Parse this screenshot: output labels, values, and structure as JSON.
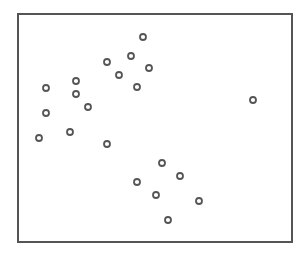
{
  "chart_data": {
    "type": "scatter",
    "title": "",
    "xlabel": "",
    "ylabel": "",
    "grid": false,
    "legend": null,
    "axis_ticks": "none",
    "marker": "open-circle",
    "colors": {
      "frame": "#555555",
      "marker": "#555555",
      "background": "#ffffff"
    },
    "frame_px": {
      "left": 18,
      "top": 14,
      "right": 292,
      "bottom": 242
    },
    "points_px": [
      {
        "x": 143,
        "y": 37
      },
      {
        "x": 131,
        "y": 56
      },
      {
        "x": 107,
        "y": 62
      },
      {
        "x": 149,
        "y": 68
      },
      {
        "x": 119,
        "y": 75
      },
      {
        "x": 76,
        "y": 81
      },
      {
        "x": 46,
        "y": 88
      },
      {
        "x": 137,
        "y": 87
      },
      {
        "x": 76,
        "y": 94
      },
      {
        "x": 88,
        "y": 107
      },
      {
        "x": 46,
        "y": 113
      },
      {
        "x": 253,
        "y": 100
      },
      {
        "x": 39,
        "y": 138
      },
      {
        "x": 70,
        "y": 132
      },
      {
        "x": 107,
        "y": 144
      },
      {
        "x": 162,
        "y": 163
      },
      {
        "x": 180,
        "y": 176
      },
      {
        "x": 137,
        "y": 182
      },
      {
        "x": 156,
        "y": 195
      },
      {
        "x": 199,
        "y": 201
      },
      {
        "x": 168,
        "y": 220
      }
    ]
  }
}
